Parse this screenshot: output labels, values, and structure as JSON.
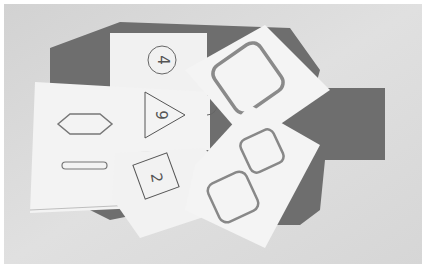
{
  "scene": {
    "description": "Grayscale photograph of overlapping white paper cards printed with outlined shapes, lying on a dark gray octagonal cutout on a light gray surface",
    "colors": {
      "surface": "#dcdcdc",
      "cutout": "#6e6e6e",
      "card": "#f2f2f2",
      "outline": "#777777",
      "thick_outline": "#8a8a8a"
    }
  },
  "cards": [
    {
      "id": "circle-card",
      "shape": "circle",
      "label": "4"
    },
    {
      "id": "triangle-card",
      "shape": "triangle",
      "label": "9"
    },
    {
      "id": "diamond-card",
      "shape": "diamond",
      "label": ""
    },
    {
      "id": "bar-card",
      "shape": "rounded-bar",
      "label": ""
    },
    {
      "id": "square-card",
      "shape": "square",
      "label": "2"
    },
    {
      "id": "big-rounded-square-card",
      "shape": "rounded-square",
      "label": ""
    },
    {
      "id": "double-rounded-square-card",
      "shape": "rounded-square-pair",
      "label": ""
    },
    {
      "id": "semicircle-mark",
      "shape": "semicircle",
      "label": ""
    }
  ]
}
